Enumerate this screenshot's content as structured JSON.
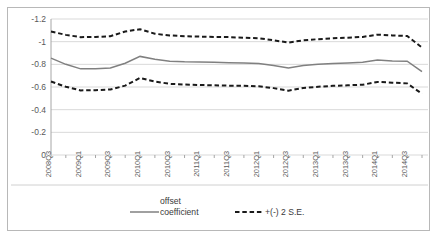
{
  "chart_data": {
    "type": "line",
    "title": "",
    "xlabel": "",
    "ylabel": "",
    "ylim": [
      0,
      -1.2
    ],
    "y_inverted": true,
    "grid": true,
    "legend_position": "bottom",
    "yticks": [
      "-1.2",
      "-1",
      "-0.8",
      "-0.6",
      "-0.4",
      "-0.2",
      "0"
    ],
    "ytick_values": [
      -1.2,
      -1.0,
      -0.8,
      -0.6,
      -0.4,
      -0.2,
      0
    ],
    "x": [
      "2008Q3",
      "2008Q4",
      "2009Q1",
      "2009Q2",
      "2009Q3",
      "2009Q4",
      "2010Q1",
      "2010Q2",
      "2010Q3",
      "2010Q4",
      "2011Q1",
      "2011Q2",
      "2011Q3",
      "2011Q4",
      "2012Q1",
      "2012Q2",
      "2012Q3",
      "2012Q4",
      "2013Q1",
      "2013Q2",
      "2013Q3",
      "2013Q4",
      "2014Q1",
      "2014Q2",
      "2014Q3",
      "2014Q4"
    ],
    "xtick_labels": [
      "2008Q3",
      "2009Q1",
      "2009Q3",
      "2010Q1",
      "2010Q3",
      "2011Q1",
      "2011Q3",
      "2012Q1",
      "2012Q3",
      "2013Q1",
      "2013Q3",
      "2014Q1",
      "2014Q3"
    ],
    "series": [
      {
        "name": "offset coefficient",
        "style": "solid",
        "color": "#808080",
        "values": [
          -0.855,
          -0.8,
          -0.76,
          -0.762,
          -0.768,
          -0.81,
          -0.87,
          -0.845,
          -0.828,
          -0.822,
          -0.82,
          -0.818,
          -0.815,
          -0.812,
          -0.808,
          -0.79,
          -0.768,
          -0.79,
          -0.8,
          -0.808,
          -0.812,
          -0.818,
          -0.838,
          -0.83,
          -0.828,
          -0.735
        ]
      },
      {
        "name": "+(-) 2 S.E.",
        "style": "dashed",
        "color": "#1a1a1a",
        "band": "upper",
        "values": [
          -1.09,
          -1.06,
          -1.04,
          -1.042,
          -1.048,
          -1.09,
          -1.11,
          -1.07,
          -1.055,
          -1.048,
          -1.045,
          -1.042,
          -1.04,
          -1.035,
          -1.03,
          -1.012,
          -0.992,
          -1.012,
          -1.022,
          -1.03,
          -1.035,
          -1.042,
          -1.062,
          -1.055,
          -1.05,
          -0.948
        ]
      },
      {
        "name": "+(-) 2 S.E.",
        "style": "dashed",
        "color": "#1a1a1a",
        "band": "lower",
        "values": [
          -0.648,
          -0.602,
          -0.57,
          -0.572,
          -0.578,
          -0.612,
          -0.68,
          -0.648,
          -0.628,
          -0.622,
          -0.618,
          -0.615,
          -0.612,
          -0.61,
          -0.606,
          -0.59,
          -0.568,
          -0.592,
          -0.602,
          -0.61,
          -0.615,
          -0.62,
          -0.645,
          -0.638,
          -0.632,
          -0.54
        ]
      }
    ]
  },
  "legend": {
    "coefficient_label_line1": "offset",
    "coefficient_label_line2": "coefficient",
    "se_label": "+(-) 2 S.E."
  }
}
